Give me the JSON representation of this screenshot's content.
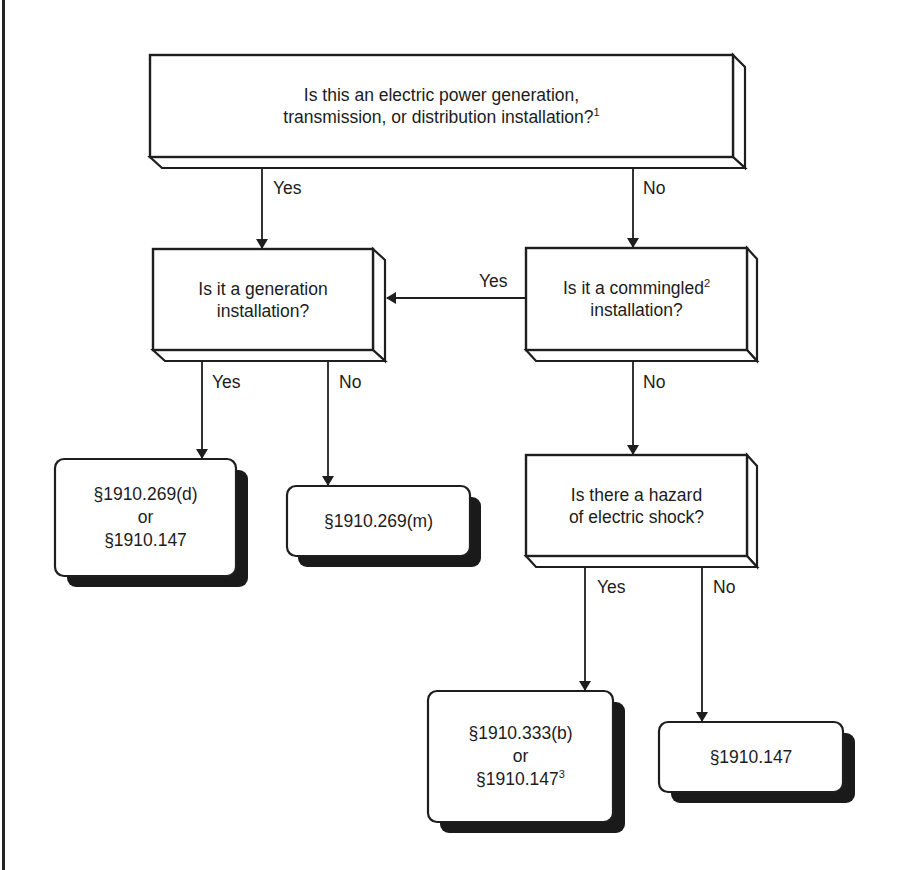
{
  "diagram": {
    "type": "flowchart",
    "nodes": {
      "q1": {
        "line1": "Is this an electric power generation,",
        "line2": "transmission, or distribution installation?",
        "footnote": "1"
      },
      "q2": {
        "line1": "Is it a generation",
        "line2": "installation?"
      },
      "q3": {
        "line1": "Is it a commingled",
        "line1_footnote": "2",
        "line2": "installation?"
      },
      "q4": {
        "line1": "Is there a hazard",
        "line2": "of electric shock?"
      },
      "r1": {
        "line1": "§1910.269(d)",
        "line2": "or",
        "line3": "§1910.147"
      },
      "r2": {
        "line1": "§1910.269(m)"
      },
      "r3": {
        "line1": "§1910.333(b)",
        "line2": "or",
        "line3": "§1910.147",
        "line3_footnote": "3"
      },
      "r4": {
        "line1": "§1910.147"
      }
    },
    "edges": {
      "q1_yes": "Yes",
      "q1_no": "No",
      "q3_yes": "Yes",
      "q3_no": "No",
      "q2_yes": "Yes",
      "q2_no": "No",
      "q4_yes": "Yes",
      "q4_no": "No"
    },
    "colors": {
      "stroke": "#1e1e1e",
      "shadow": "#1a1a1a",
      "fill": "#ffffff"
    }
  }
}
